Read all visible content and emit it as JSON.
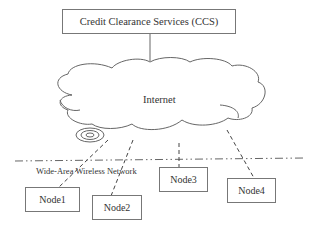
{
  "diagram": {
    "ccs": {
      "label": "Credit Clearance Services (CCS)"
    },
    "cloud": {
      "label": "Internet"
    },
    "network": {
      "label": "Wide-Area Wireless Network"
    },
    "nodes": [
      {
        "label": "Node1"
      },
      {
        "label": "Node2"
      },
      {
        "label": "Node3"
      },
      {
        "label": "Node4"
      }
    ],
    "colors": {
      "line": "#666666",
      "text": "#333333",
      "background": "#ffffff"
    }
  }
}
